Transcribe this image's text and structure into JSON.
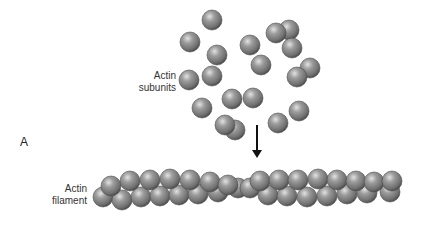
{
  "panel_label": "A",
  "labels": {
    "subunits_line1": "Actin",
    "subunits_line2": "subunits",
    "filament_line1": "Actin",
    "filament_line2": "filament"
  },
  "colors": {
    "sphere_highlight": "#d9d9d9",
    "sphere_mid": "#8f8f8f",
    "sphere_shadow": "#555555",
    "arrow": "#111111",
    "text": "#333333"
  },
  "subunits": [
    {
      "cx": 212,
      "cy": 20,
      "r": 10
    },
    {
      "cx": 190,
      "cy": 42,
      "r": 10
    },
    {
      "cx": 217,
      "cy": 55,
      "r": 10
    },
    {
      "cx": 250,
      "cy": 45,
      "r": 10
    },
    {
      "cx": 289,
      "cy": 30,
      "r": 10
    },
    {
      "cx": 276,
      "cy": 33,
      "r": 10
    },
    {
      "cx": 292,
      "cy": 48,
      "r": 10
    },
    {
      "cx": 261,
      "cy": 65,
      "r": 10
    },
    {
      "cx": 310,
      "cy": 68,
      "r": 10
    },
    {
      "cx": 297,
      "cy": 77,
      "r": 10
    },
    {
      "cx": 189,
      "cy": 80,
      "r": 10
    },
    {
      "cx": 212,
      "cy": 76,
      "r": 10
    },
    {
      "cx": 232,
      "cy": 99,
      "r": 10
    },
    {
      "cx": 253,
      "cy": 98,
      "r": 10
    },
    {
      "cx": 202,
      "cy": 108,
      "r": 10
    },
    {
      "cx": 299,
      "cy": 111,
      "r": 10
    },
    {
      "cx": 235,
      "cy": 130,
      "r": 10
    },
    {
      "cx": 225,
      "cy": 125,
      "r": 10
    },
    {
      "cx": 278,
      "cy": 123,
      "r": 10
    }
  ],
  "filament_bottom": [
    {
      "cx": 103,
      "cy": 197
    },
    {
      "cx": 122,
      "cy": 200
    },
    {
      "cx": 141,
      "cy": 197
    },
    {
      "cx": 160,
      "cy": 196
    },
    {
      "cx": 179,
      "cy": 195
    },
    {
      "cx": 198,
      "cy": 194
    },
    {
      "cx": 218,
      "cy": 192
    },
    {
      "cx": 238,
      "cy": 188
    },
    {
      "cx": 250,
      "cy": 188
    },
    {
      "cx": 268,
      "cy": 195
    },
    {
      "cx": 287,
      "cy": 196
    },
    {
      "cx": 307,
      "cy": 197
    },
    {
      "cx": 327,
      "cy": 196
    },
    {
      "cx": 347,
      "cy": 194
    },
    {
      "cx": 367,
      "cy": 193
    },
    {
      "cx": 390,
      "cy": 192
    }
  ],
  "filament_top": [
    {
      "cx": 111,
      "cy": 186
    },
    {
      "cx": 130,
      "cy": 181
    },
    {
      "cx": 150,
      "cy": 180
    },
    {
      "cx": 170,
      "cy": 179
    },
    {
      "cx": 190,
      "cy": 180
    },
    {
      "cx": 210,
      "cy": 182
    },
    {
      "cx": 228,
      "cy": 185
    },
    {
      "cx": 260,
      "cy": 181
    },
    {
      "cx": 279,
      "cy": 180
    },
    {
      "cx": 298,
      "cy": 180
    },
    {
      "cx": 318,
      "cy": 179
    },
    {
      "cx": 337,
      "cy": 180
    },
    {
      "cx": 356,
      "cy": 181
    },
    {
      "cx": 374,
      "cy": 182
    },
    {
      "cx": 392,
      "cy": 181
    }
  ],
  "filament_radius": 10,
  "arrow": {
    "x": 257,
    "y1": 125,
    "y2": 158
  }
}
